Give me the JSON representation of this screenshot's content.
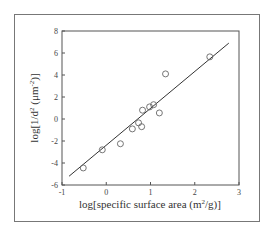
{
  "chart_data": {
    "type": "scatter",
    "title": "",
    "xlabel": "log[specific surface area (m²/g)]",
    "ylabel": "log[1/d² (μm⁻²)]",
    "xlim": [
      -1,
      3
    ],
    "ylim": [
      -6,
      8
    ],
    "xticks": [
      "-1",
      "0",
      "1",
      "2",
      "3"
    ],
    "yticks": [
      "8",
      "6",
      "4",
      "2",
      "0",
      "-2",
      "-4",
      "-6"
    ],
    "grid": false,
    "legend": null,
    "series": [
      {
        "name": "data",
        "marker": "open-circle",
        "points": [
          {
            "x": -0.52,
            "y": -4.45
          },
          {
            "x": -0.09,
            "y": -2.8
          },
          {
            "x": 0.32,
            "y": -2.25
          },
          {
            "x": 0.59,
            "y": -0.9
          },
          {
            "x": 0.73,
            "y": -0.35
          },
          {
            "x": 0.8,
            "y": -0.7
          },
          {
            "x": 0.82,
            "y": 0.8
          },
          {
            "x": 0.98,
            "y": 1.1
          },
          {
            "x": 1.07,
            "y": 1.3
          },
          {
            "x": 1.2,
            "y": 0.55
          },
          {
            "x": 1.34,
            "y": 4.1
          },
          {
            "x": 2.34,
            "y": 5.65
          }
        ]
      },
      {
        "name": "linear fit",
        "type": "line",
        "points": [
          {
            "x": -0.84,
            "y": -5.2
          },
          {
            "x": 2.77,
            "y": 6.9
          }
        ]
      }
    ]
  },
  "axes": {
    "x_label": "log[specific surface area (m",
    "x_label_sup": "2",
    "x_label_end": "/g)]",
    "y_label": "log[1/d",
    "y_label_sup": "2",
    "y_label_mid": " (μm",
    "y_label_sup2": "-2",
    "y_label_end": ")]"
  }
}
